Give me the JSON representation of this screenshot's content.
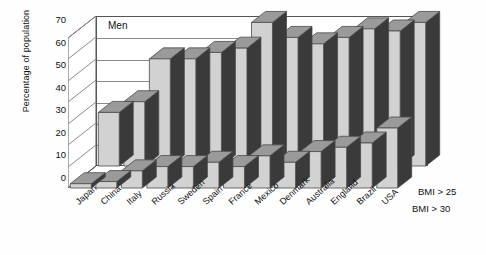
{
  "chart_data": {
    "type": "bar",
    "title": "Men",
    "xlabel": "",
    "ylabel": "Percentage of population",
    "ylim": [
      0,
      70
    ],
    "yticks": [
      0,
      10,
      20,
      30,
      40,
      50,
      60,
      70
    ],
    "grid": true,
    "legend_position": "right-bottom",
    "projection": "3d-grouped-depth",
    "categories": [
      "Japan",
      "China",
      "Italy",
      "Russia",
      "Sweden",
      "Spain",
      "France",
      "Mexico",
      "Denmark",
      "Australia",
      "England",
      "Brazil",
      "USA"
    ],
    "series": [
      {
        "name": "BMI > 25",
        "row": "back",
        "values": [
          25,
          30,
          50,
          50,
          53,
          55,
          67,
          60,
          57,
          60,
          64,
          63,
          67
        ]
      },
      {
        "name": "BMI > 30",
        "row": "front",
        "values": [
          2,
          3,
          8,
          10,
          10,
          12,
          10,
          15,
          12,
          17,
          19,
          21,
          28
        ]
      }
    ]
  },
  "axis": {
    "ylabel": "Percentage of population",
    "ticks": [
      "70",
      "60",
      "50",
      "40",
      "30",
      "20",
      "10",
      "0"
    ]
  },
  "plot": {
    "title": "Men"
  },
  "legend": {
    "item_bmi25": "BMI > 25",
    "item_bmi30": "BMI > 30"
  },
  "colors": {
    "bar_front_face": "#d2d2d2",
    "bar_top_face": "#9a9a9a",
    "bar_side_dark": "#3a3a3a",
    "axis_line": "#555555",
    "grid_line": "#8a8a8a",
    "text": "#111111",
    "background": "#ffffff"
  }
}
